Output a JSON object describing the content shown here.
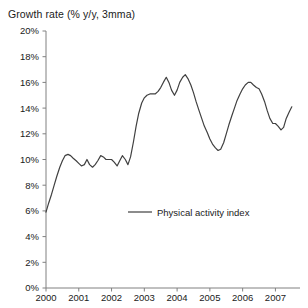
{
  "chart_data": {
    "type": "line",
    "title": "Growth rate (% y/y, 3mma)",
    "xlabel": "",
    "ylabel": "",
    "ylim": [
      0,
      20
    ],
    "xlim": [
      2000,
      2007.75
    ],
    "grid": false,
    "legend_position": "center",
    "ytick_labels": [
      "0%",
      "2%",
      "4%",
      "6%",
      "8%",
      "10%",
      "12%",
      "14%",
      "16%",
      "18%",
      "20%"
    ],
    "ytick_values": [
      0,
      2,
      4,
      6,
      8,
      10,
      12,
      14,
      16,
      18,
      20
    ],
    "xtick_labels": [
      "2000",
      "2001",
      "2002",
      "2003",
      "2004",
      "2005",
      "2006",
      "2007"
    ],
    "xtick_values": [
      2000,
      2001,
      2002,
      2003,
      2004,
      2005,
      2006,
      2007
    ],
    "series": [
      {
        "name": "Physical activity index",
        "color": "#404040",
        "x": [
          2000.0,
          2000.08,
          2000.17,
          2000.25,
          2000.33,
          2000.42,
          2000.5,
          2000.58,
          2000.67,
          2000.75,
          2000.83,
          2000.92,
          2001.0,
          2001.08,
          2001.17,
          2001.25,
          2001.33,
          2001.42,
          2001.5,
          2001.58,
          2001.67,
          2001.75,
          2001.83,
          2001.92,
          2002.0,
          2002.08,
          2002.17,
          2002.25,
          2002.33,
          2002.42,
          2002.5,
          2002.58,
          2002.67,
          2002.75,
          2002.83,
          2002.92,
          2003.0,
          2003.08,
          2003.17,
          2003.25,
          2003.33,
          2003.42,
          2003.5,
          2003.58,
          2003.67,
          2003.75,
          2003.83,
          2003.92,
          2004.0,
          2004.08,
          2004.17,
          2004.25,
          2004.33,
          2004.42,
          2004.5,
          2004.58,
          2004.67,
          2004.75,
          2004.83,
          2004.92,
          2005.0,
          2005.08,
          2005.17,
          2005.25,
          2005.33,
          2005.42,
          2005.5,
          2005.58,
          2005.67,
          2005.75,
          2005.83,
          2005.92,
          2006.0,
          2006.08,
          2006.17,
          2006.25,
          2006.33,
          2006.42,
          2006.5,
          2006.58,
          2006.67,
          2006.75,
          2006.83,
          2006.92,
          2007.0,
          2007.08,
          2007.17,
          2007.25,
          2007.33,
          2007.42,
          2007.5
        ],
        "values": [
          5.9,
          6.6,
          7.3,
          8.0,
          8.7,
          9.4,
          9.9,
          10.3,
          10.4,
          10.3,
          10.1,
          9.9,
          9.7,
          9.5,
          9.6,
          10.0,
          9.6,
          9.4,
          9.6,
          9.9,
          10.3,
          10.2,
          10.0,
          10.0,
          10.0,
          9.8,
          9.5,
          9.9,
          10.3,
          10.0,
          9.6,
          10.2,
          11.4,
          12.6,
          13.6,
          14.4,
          14.8,
          15.0,
          15.1,
          15.1,
          15.1,
          15.3,
          15.6,
          16.0,
          16.4,
          16.0,
          15.4,
          15.0,
          15.4,
          16.0,
          16.4,
          16.6,
          16.3,
          15.8,
          15.2,
          14.5,
          13.8,
          13.2,
          12.6,
          12.1,
          11.6,
          11.2,
          10.9,
          10.7,
          10.8,
          11.3,
          12.0,
          12.7,
          13.4,
          14.0,
          14.6,
          15.1,
          15.5,
          15.8,
          16.0,
          16.0,
          15.8,
          15.6,
          15.5,
          15.1,
          14.5,
          13.8,
          13.2,
          12.8,
          12.8,
          12.6,
          12.3,
          12.5,
          13.2,
          13.7,
          14.1
        ]
      }
    ]
  },
  "legend": {
    "label": "Physical activity index"
  }
}
